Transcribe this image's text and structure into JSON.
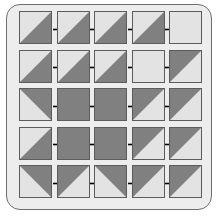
{
  "figure": {
    "type": "diagram",
    "rows": 5,
    "columns": 5,
    "colors": {
      "page_background": "#ffffff",
      "frame_background": "#ededed",
      "frame_border": "#6e6e6e",
      "cell_border": "#5c5c5c",
      "cell_light": "#e3e3e3",
      "cell_dark": "#808080",
      "arrow": "#000000"
    },
    "cell_states": {
      "light": "all-light",
      "dark": "all-dark",
      "dark-lower-right": "diagonal-bottomleft-to-topright-dark-below",
      "dark-upper-left": "diagonal-bottomleft-to-topright-dark-above",
      "dark-upper-right": "diagonal-topleft-to-bottomright-dark-above",
      "dark-lower-left": "diagonal-topleft-to-bottomright-dark-below"
    },
    "grid": [
      {
        "row_index": 1,
        "cells": [
          {
            "index": 1,
            "state": "dark-lower-right"
          },
          {
            "index": 2,
            "state": "dark-lower-right"
          },
          {
            "index": 3,
            "state": "dark-lower-right"
          },
          {
            "index": 4,
            "state": "dark-lower-right"
          },
          {
            "index": 5,
            "state": "light"
          }
        ],
        "arrows": 4
      },
      {
        "row_index": 2,
        "cells": [
          {
            "index": 1,
            "state": "dark-lower-right"
          },
          {
            "index": 2,
            "state": "dark-lower-right"
          },
          {
            "index": 3,
            "state": "dark-lower-right"
          },
          {
            "index": 4,
            "state": "light"
          },
          {
            "index": 5,
            "state": "dark-upper-left"
          }
        ],
        "arrows": 4
      },
      {
        "row_index": 3,
        "cells": [
          {
            "index": 1,
            "state": "dark-upper-right"
          },
          {
            "index": 2,
            "state": "dark"
          },
          {
            "index": 3,
            "state": "dark"
          },
          {
            "index": 4,
            "state": "dark-upper-left"
          },
          {
            "index": 5,
            "state": "dark-upper-left"
          }
        ],
        "arrows": 4
      },
      {
        "row_index": 4,
        "cells": [
          {
            "index": 1,
            "state": "dark-lower-right"
          },
          {
            "index": 2,
            "state": "dark"
          },
          {
            "index": 3,
            "state": "dark"
          },
          {
            "index": 4,
            "state": "dark-upper-left"
          },
          {
            "index": 5,
            "state": "dark-upper-left"
          }
        ],
        "arrows": 4
      },
      {
        "row_index": 5,
        "cells": [
          {
            "index": 1,
            "state": "dark-upper-right"
          },
          {
            "index": 2,
            "state": "dark-upper-left"
          },
          {
            "index": 3,
            "state": "dark-upper-right"
          },
          {
            "index": 4,
            "state": "dark-upper-left"
          },
          {
            "index": 5,
            "state": "dark-upper-left"
          }
        ],
        "arrows": 4
      }
    ]
  }
}
